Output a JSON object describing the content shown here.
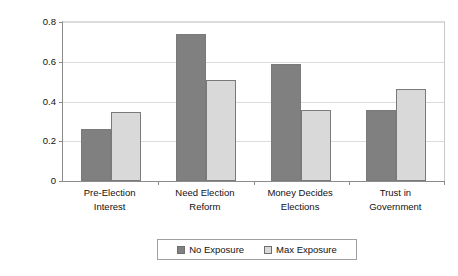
{
  "chart_data": {
    "type": "bar",
    "title": "",
    "subtitle": "",
    "xlabel": "",
    "ylabel": "Average Probability",
    "ylim": [
      0,
      0.8
    ],
    "yticks": [
      0,
      0.2,
      0.4,
      0.6,
      0.8
    ],
    "ytick_labels": [
      "0",
      "0.2",
      "0.4",
      "0.6",
      "0.8"
    ],
    "grid": true,
    "legend_position": "bottom",
    "categories": [
      "Pre-Election Interest",
      "Need Election Reform",
      "Money Decides Elections",
      "Trust in Government"
    ],
    "category_lines": [
      [
        "Pre-Election",
        "Interest"
      ],
      [
        "Need Election",
        "Reform"
      ],
      [
        "Money Decides",
        "Elections"
      ],
      [
        "Trust in",
        "Government"
      ]
    ],
    "series": [
      {
        "name": "No Exposure",
        "color": "#808080",
        "values": [
          0.26,
          0.74,
          0.59,
          0.355
        ]
      },
      {
        "name": "Max Exposure",
        "color": "#d9d9d9",
        "values": [
          0.345,
          0.51,
          0.355,
          0.465
        ]
      }
    ]
  },
  "colors": {
    "no_exposure": "#808080",
    "max_exposure": "#d9d9d9",
    "axis": "#8c8c8c",
    "gridline": "#dcdcdc",
    "background": "#ffffff",
    "text": "#111111"
  }
}
